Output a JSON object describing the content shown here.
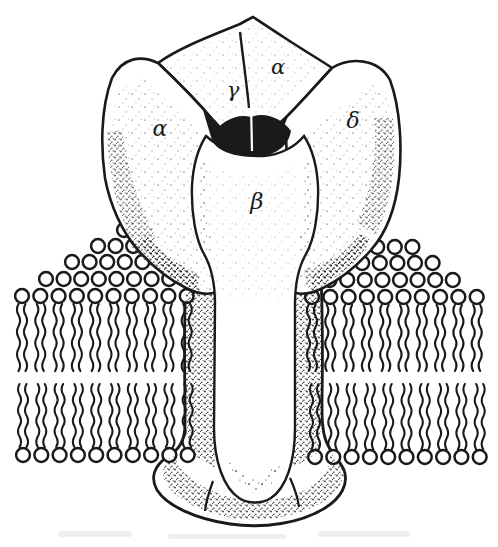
{
  "colors": {
    "ink": "#1a1a1a",
    "paper": "#ffffff"
  },
  "subunits": [
    {
      "id": "alpha-left",
      "label": "α"
    },
    {
      "id": "gamma",
      "label": "γ"
    },
    {
      "id": "alpha-top",
      "label": "α"
    },
    {
      "id": "delta",
      "label": "δ"
    },
    {
      "id": "beta",
      "label": "β"
    }
  ]
}
